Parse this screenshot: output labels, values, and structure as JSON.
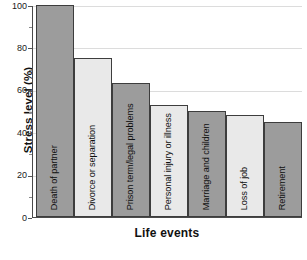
{
  "chart_data": {
    "type": "bar",
    "title": "",
    "xlabel": "Life events",
    "ylabel": "Stress level (%)",
    "categories": [
      "Death of partner",
      "Divorce or separation",
      "Prison term/legal problems",
      "Personal injury or illness",
      "Marriage and children",
      "Loss of job",
      "Retirement"
    ],
    "values": [
      100,
      75,
      63,
      53,
      50,
      48,
      45
    ],
    "ylim": [
      0,
      100
    ],
    "yticks": [
      0,
      20,
      40,
      60,
      80,
      100
    ],
    "ytick_labels": [
      "0",
      "20",
      "40",
      "60",
      "80",
      "100"
    ],
    "minor_yticks": [
      10,
      30,
      50,
      70,
      90
    ],
    "grid": "horizontal",
    "legend": "none",
    "bar_colors": [
      "#9c9c9c",
      "#e9e9e9",
      "#9c9c9c",
      "#e9e9e9",
      "#9c9c9c",
      "#e9e9e9",
      "#9c9c9c"
    ],
    "bar_styles": [
      "dark",
      "light",
      "dark",
      "light",
      "dark",
      "light",
      "dark"
    ],
    "bar_edge_color": "#3d3d3d",
    "gridline_color": "#dcdcdc",
    "axis_color": "#4a4a4a"
  }
}
